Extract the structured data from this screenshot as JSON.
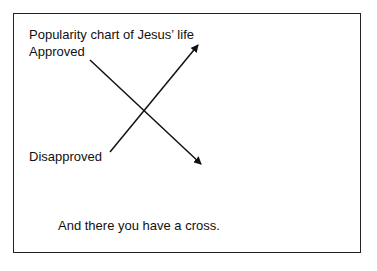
{
  "diagram": {
    "title": "Popularity chart of Jesus’ life",
    "labels": {
      "approved": "Approved",
      "disapproved": "Disapproved"
    },
    "caption": "And there you have a cross.",
    "lines": [
      {
        "name": "approved-to-disapproved",
        "from": [
          90,
          60
        ],
        "to": [
          201,
          164
        ],
        "arrow": "end"
      },
      {
        "name": "disapproved-to-approved",
        "from": [
          110,
          152
        ],
        "to": [
          198,
          45
        ],
        "arrow": "end"
      }
    ],
    "colors": {
      "line": "#111111",
      "border": "#222222",
      "background": "#ffffff"
    }
  }
}
